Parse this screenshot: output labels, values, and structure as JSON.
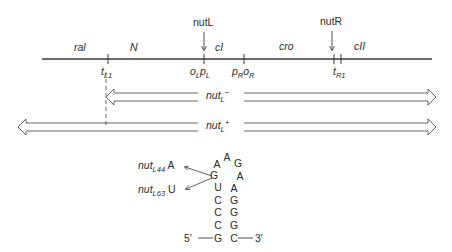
{
  "figure": {
    "type": "lambda phage genetic map with nut site stem-loop",
    "colors": {
      "line": "#3a3a3a",
      "text": "#2a2a2a",
      "background": "#ffffff"
    }
  },
  "sites_above": [
    {
      "label": "nutL",
      "x": 204
    },
    {
      "label": "nutR",
      "x": 332
    }
  ],
  "genes": [
    {
      "label": "ral",
      "x": 80
    },
    {
      "label": "N",
      "x": 133
    },
    {
      "label": "cI",
      "x": 220
    },
    {
      "label": "cro",
      "x": 287
    },
    {
      "label": "cII",
      "x": 360
    }
  ],
  "markers": {
    "tL1": {
      "base": "t",
      "sub": "L1"
    },
    "oLpL": {
      "o": "o",
      "o_sub": "L",
      "p": "p",
      "p_sub": "L"
    },
    "pRoR": {
      "p": "p",
      "p_sub": "R",
      "o": "o",
      "o_sub": "R"
    },
    "tR1": {
      "base": "t",
      "sub": "R1"
    }
  },
  "transcripts": [
    {
      "name": "nut",
      "sub": "L",
      "sup": "−",
      "start_x": 106,
      "end_x": 436
    },
    {
      "name": "nut",
      "sub": "L",
      "sup": "+",
      "start_x": 18,
      "end_x": 436
    }
  ],
  "stem_loop": {
    "left_strand": [
      "G",
      "C",
      "C",
      "C",
      "U",
      "G",
      "A"
    ],
    "loop": [
      "A",
      "G"
    ],
    "right_strand": [
      "A",
      "A",
      "G",
      "G",
      "G",
      "C"
    ],
    "five_prime": "5′",
    "three_prime": "3′",
    "mutations": [
      {
        "name": "nut",
        "sub": "L44",
        "base": "A"
      },
      {
        "name": "nut",
        "sub": "L63",
        "base": "U"
      }
    ]
  }
}
